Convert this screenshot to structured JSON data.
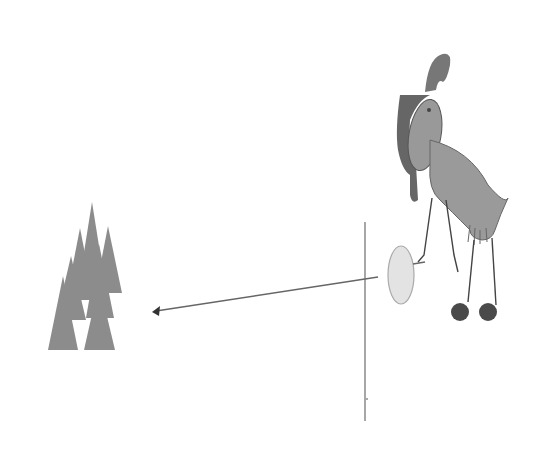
{
  "canvas": {
    "width": 552,
    "height": 461,
    "background": "#ffffff"
  },
  "colors": {
    "trees": "#8a8a8a",
    "line": "#6a6a6a",
    "bird_body": "#9a9a9a",
    "bird_dark": "#555555",
    "racket": "#e2e2e2",
    "feet": "#4a4a4a"
  },
  "elements": {
    "tree_cluster": {
      "label": "Tree cluster",
      "count": 7
    },
    "net_line": {
      "label": "Vertical line (net)"
    },
    "arrow": {
      "label": "Arrow pointing left",
      "direction": "left"
    },
    "bird": {
      "label": "Cartoon bird holding racket"
    },
    "racket": {
      "label": "Oval racket"
    }
  }
}
